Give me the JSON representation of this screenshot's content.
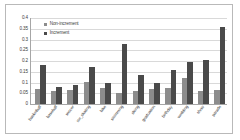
{
  "chart_data": {
    "type": "bar",
    "title": "",
    "xlabel": "",
    "ylabel": "",
    "ylim": [
      0,
      0.4
    ],
    "ytick_step": 0.05,
    "yticks": [
      "0.4",
      "0.35",
      "0.3",
      "0.25",
      "0.2",
      "0.15",
      "0.1",
      "0.05",
      "0"
    ],
    "grid": true,
    "legend_position": "top-left",
    "categories": [
      "basketball",
      "baseball",
      "soccer",
      "ice_skating",
      "bike",
      "swimming",
      "skiing",
      "graduation",
      "birthday",
      "wedding",
      "show",
      "parade"
    ],
    "series": [
      {
        "name": "Non-increment",
        "color": "#8c8c8c",
        "values": [
          0.072,
          0.06,
          0.067,
          0.102,
          0.073,
          0.053,
          0.062,
          0.069,
          0.075,
          0.119,
          0.06,
          0.063
        ]
      },
      {
        "name": "Increment",
        "color": "#4a4a4a",
        "values": [
          0.181,
          0.079,
          0.09,
          0.172,
          0.1,
          0.277,
          0.137,
          0.1,
          0.16,
          0.197,
          0.206,
          0.359
        ]
      }
    ]
  }
}
